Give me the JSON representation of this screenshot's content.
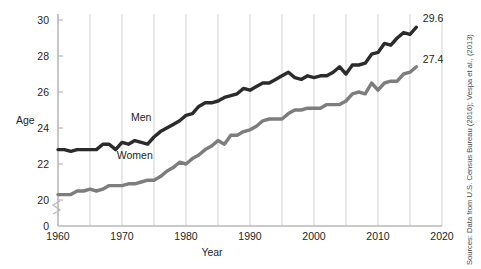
{
  "chart_data": {
    "type": "line",
    "title": "",
    "xlabel": "Year",
    "ylabel": "Age",
    "xlim": [
      1960,
      2020
    ],
    "ylim": [
      20,
      30
    ],
    "y_axis_break": true,
    "y_axis_zero_label": "0",
    "grid": "vertical gridlines every 5 years",
    "legend_position": "inline labels on series",
    "x_ticks": [
      1960,
      1970,
      1980,
      1990,
      2000,
      2010,
      2020
    ],
    "x_tick_labels": [
      "1960",
      "1970",
      "1980",
      "1990",
      "2000",
      "2010",
      "2020"
    ],
    "x_gridlines": [
      1960,
      1965,
      1970,
      1975,
      1980,
      1985,
      1990,
      1995,
      2000,
      2005,
      2010,
      2015,
      2020
    ],
    "y_ticks": [
      0,
      20,
      22,
      24,
      26,
      28,
      30
    ],
    "y_tick_labels": [
      "0",
      "20",
      "22",
      "24",
      "26",
      "28",
      "30"
    ],
    "colors": {
      "men": "#2b2b2b",
      "women": "#7d7d7d",
      "gridline": "#d2d2d2",
      "axis": "#b9b9b9",
      "text": "#1d1d1d"
    },
    "series": [
      {
        "name": "Men",
        "label": "Men",
        "color": "#2b2b2b",
        "end_value_label": "29.6",
        "x": [
          1960,
          1961,
          1962,
          1963,
          1964,
          1965,
          1966,
          1967,
          1968,
          1969,
          1970,
          1971,
          1972,
          1973,
          1974,
          1975,
          1976,
          1977,
          1978,
          1979,
          1980,
          1981,
          1982,
          1983,
          1984,
          1985,
          1986,
          1987,
          1988,
          1989,
          1990,
          1991,
          1992,
          1993,
          1994,
          1995,
          1996,
          1997,
          1998,
          1999,
          2000,
          2001,
          2002,
          2003,
          2004,
          2005,
          2006,
          2007,
          2008,
          2009,
          2010,
          2011,
          2012,
          2013,
          2014,
          2015,
          2016
        ],
        "values": [
          22.8,
          22.8,
          22.7,
          22.8,
          22.8,
          22.8,
          22.8,
          23.1,
          23.1,
          22.8,
          23.2,
          23.1,
          23.3,
          23.2,
          23.1,
          23.5,
          23.8,
          24.0,
          24.2,
          24.4,
          24.7,
          24.8,
          25.2,
          25.4,
          25.4,
          25.5,
          25.7,
          25.8,
          25.9,
          26.2,
          26.1,
          26.3,
          26.5,
          26.5,
          26.7,
          26.9,
          27.1,
          26.8,
          26.7,
          26.9,
          26.8,
          26.9,
          26.9,
          27.1,
          27.4,
          27.0,
          27.5,
          27.5,
          27.6,
          28.1,
          28.2,
          28.7,
          28.6,
          29.0,
          29.3,
          29.2,
          29.6
        ]
      },
      {
        "name": "Women",
        "label": "Women",
        "color": "#7d7d7d",
        "end_value_label": "27.4",
        "x": [
          1960,
          1961,
          1962,
          1963,
          1964,
          1965,
          1966,
          1967,
          1968,
          1969,
          1970,
          1971,
          1972,
          1973,
          1974,
          1975,
          1976,
          1977,
          1978,
          1979,
          1980,
          1981,
          1982,
          1983,
          1984,
          1985,
          1986,
          1987,
          1988,
          1989,
          1990,
          1991,
          1992,
          1993,
          1994,
          1995,
          1996,
          1997,
          1998,
          1999,
          2000,
          2001,
          2002,
          2003,
          2004,
          2005,
          2006,
          2007,
          2008,
          2009,
          2010,
          2011,
          2012,
          2013,
          2014,
          2015,
          2016
        ],
        "values": [
          20.3,
          20.3,
          20.3,
          20.5,
          20.5,
          20.6,
          20.5,
          20.6,
          20.8,
          20.8,
          20.8,
          20.9,
          20.9,
          21.0,
          21.1,
          21.1,
          21.3,
          21.6,
          21.8,
          22.1,
          22.0,
          22.3,
          22.5,
          22.8,
          23.0,
          23.3,
          23.1,
          23.6,
          23.6,
          23.8,
          23.9,
          24.1,
          24.4,
          24.5,
          24.5,
          24.5,
          24.8,
          25.0,
          25.0,
          25.1,
          25.1,
          25.1,
          25.3,
          25.3,
          25.3,
          25.5,
          25.9,
          26.0,
          25.9,
          26.5,
          26.1,
          26.5,
          26.6,
          26.6,
          27.0,
          27.1,
          27.4
        ]
      }
    ],
    "annotations": [
      {
        "text": "Men",
        "x": 1973,
        "y": 24.4
      },
      {
        "text": "Women",
        "x": 1972,
        "y": 22.3
      },
      {
        "text": "29.6",
        "x": 2017,
        "y": 29.9
      },
      {
        "text": "27.4",
        "x": 2017,
        "y": 27.6
      }
    ],
    "source_note": "Sources: Data from U.S. Census Bureau (2016); Vespa et al., (2013)"
  }
}
